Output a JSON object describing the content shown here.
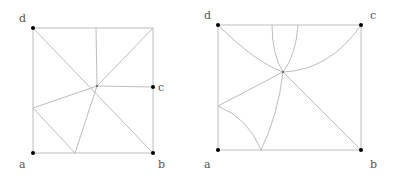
{
  "figures": [
    {
      "id": "left",
      "type": "square-subdivision-straight",
      "labels": {
        "a": "a",
        "b": "b",
        "c": "c",
        "d": "d"
      }
    },
    {
      "id": "right",
      "type": "square-subdivision-curved",
      "labels": {
        "a": "a",
        "b": "b",
        "c": "c",
        "d": "d"
      }
    }
  ],
  "colors": {
    "edge": "#bdbdbd",
    "vertex": "#000000",
    "label": "#555555"
  }
}
